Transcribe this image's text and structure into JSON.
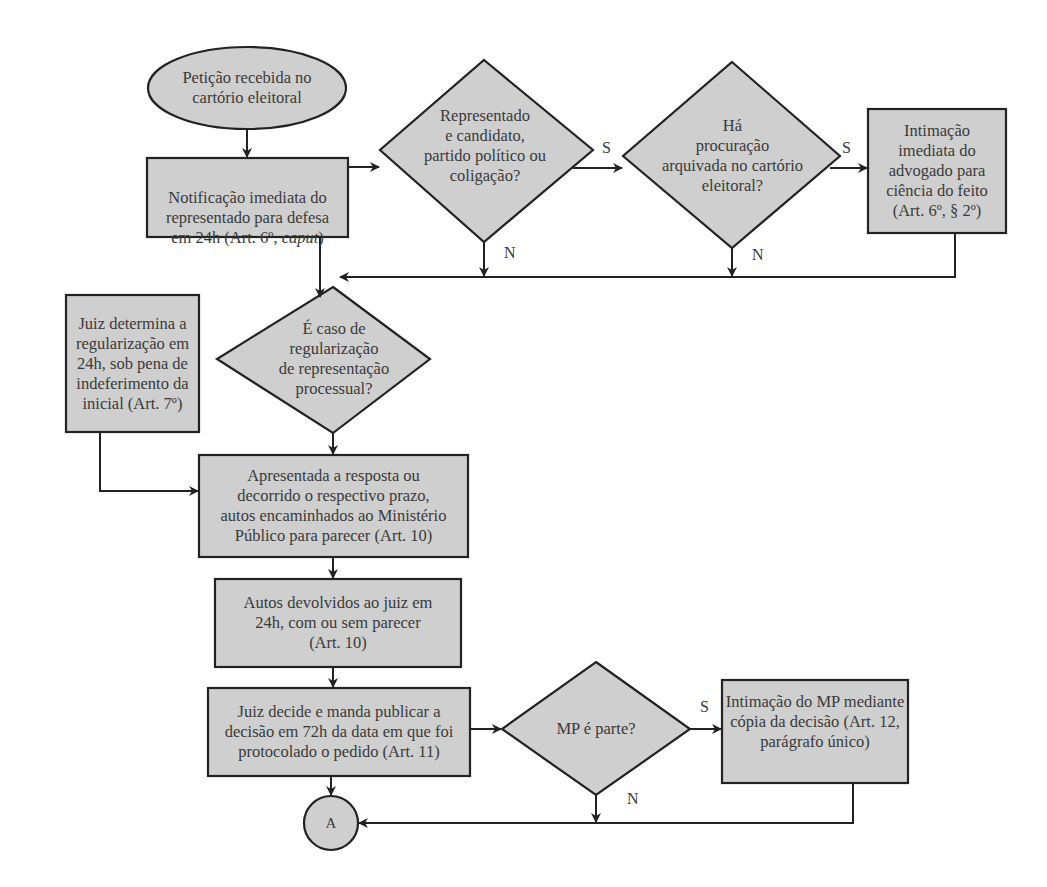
{
  "diagram": {
    "type": "flowchart",
    "colors": {
      "fill": "#cfcfcf",
      "stroke": "#222222",
      "text": "#3a3a3a",
      "background": "#ffffff"
    },
    "nodes": {
      "start": {
        "shape": "ellipse",
        "text": "Petição recebida no\ncartório eleitoral"
      },
      "notificacao": {
        "shape": "rect",
        "text_a": "Notificação imediata do\nrepresentado para defesa\nem 24h (Art. 6º, ",
        "text_b": "caput",
        "text_c": ")"
      },
      "decisao_candidato": {
        "shape": "diamond",
        "text": "Representado\ne candidato,\npartido político ou\ncoligação?"
      },
      "decisao_procuracao": {
        "shape": "diamond",
        "text": "Há\nprocuração\narquivada no cartório\neleitoral?"
      },
      "intimacao_advogado": {
        "shape": "rect",
        "text": "Intimação\nimediata do\nadvogado para\nciência do feito\n(Art. 6º, § 2º)"
      },
      "decisao_regularizacao": {
        "shape": "diamond",
        "text": "É caso de\nregularização\nde representação\nprocessual?"
      },
      "juiz_regularizacao": {
        "shape": "rect",
        "text": "Juiz determina a\nregularização em\n24h, sob pena de\nindeferimento da\ninicial (Art. 7º)"
      },
      "ministerio_publico": {
        "shape": "rect",
        "text": "Apresentada a resposta ou\ndecorrido o respectivo prazo,\nautos encaminhados ao Ministério\nPúblico para parecer (Art. 10)"
      },
      "autos_devolvidos": {
        "shape": "rect",
        "text": "Autos devolvidos ao juiz em\n24h, com ou sem parecer\n(Art. 10)"
      },
      "juiz_decide": {
        "shape": "rect",
        "text": "Juiz decide e manda publicar a\ndecisão em 72h da data em que foi\nprotocolado o pedido (Art. 11)"
      },
      "decisao_mp": {
        "shape": "diamond",
        "text": "MP é parte?"
      },
      "intimacao_mp": {
        "shape": "rect",
        "text": "Intimação do MP mediante\ncópia da decisão (Art. 12,\nparágrafo único)"
      },
      "connector_a": {
        "shape": "circle",
        "text": "A"
      }
    },
    "edge_labels": {
      "candidato_yes": "S",
      "candidato_no": "N",
      "procuracao_yes": "S",
      "procuracao_no": "N",
      "mp_yes": "S",
      "mp_no": "N"
    }
  }
}
